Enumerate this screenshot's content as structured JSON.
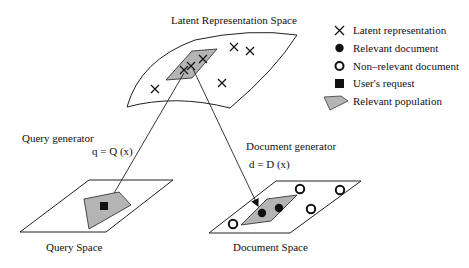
{
  "diagram": {
    "spaces": {
      "latent": {
        "label": "Latent Representation Space"
      },
      "query": {
        "label": "Query Space"
      },
      "document": {
        "label": "Document Space"
      }
    },
    "generators": {
      "query": {
        "label": "Query generator",
        "formula": "q = Q (x)"
      },
      "document": {
        "label": "Document generator",
        "formula": "d = D (x)"
      }
    },
    "legend": [
      {
        "symbol": "cross-icon",
        "label": "Latent representation"
      },
      {
        "symbol": "filled-circle-icon",
        "label": "Relevant document"
      },
      {
        "symbol": "hollow-circle-icon",
        "label": "Non–relevant document"
      },
      {
        "symbol": "filled-square-icon",
        "label": "User's request"
      },
      {
        "symbol": "gray-polygon-icon",
        "label": "Relevant population"
      }
    ],
    "colors": {
      "line": "#222222",
      "population_fill": "#b4b4b4",
      "background": "#ffffff"
    }
  }
}
